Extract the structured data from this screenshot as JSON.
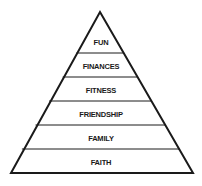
{
  "diagram": {
    "type": "pyramid",
    "stroke_color": "#1a1a1a",
    "fill_color": "#ffffff",
    "levels_top_to_bottom": [
      {
        "label": "FUN"
      },
      {
        "label": "FINANCES"
      },
      {
        "label": "FITNESS"
      },
      {
        "label": "FRIENDSHIP"
      },
      {
        "label": "FAMILY"
      },
      {
        "label": "FAITH"
      }
    ]
  }
}
